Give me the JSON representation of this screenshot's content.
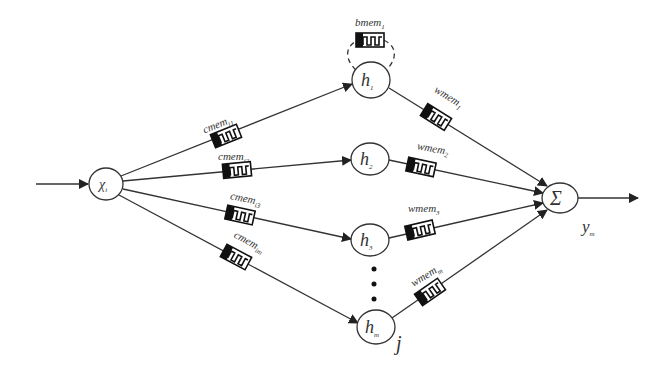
{
  "diagram": {
    "type": "memristor neural network",
    "colors": {
      "line": "#333333",
      "background": "#ffffff",
      "memristor_fill": "#111111"
    },
    "nodes": {
      "input": {
        "label": "χ",
        "sub": "i"
      },
      "h1": {
        "label": "h",
        "sub": "1"
      },
      "h2": {
        "label": "h",
        "sub": "2"
      },
      "h3": {
        "label": "h",
        "sub": "3"
      },
      "hm": {
        "label": "h",
        "sub": "m"
      },
      "sum": {
        "label": "Σ"
      }
    },
    "labels": {
      "output": "y",
      "output_sub": "m",
      "index": "j",
      "ellipsis": "⋮"
    },
    "memristors": {
      "bias": {
        "label": "bmem",
        "sub": "1"
      },
      "in": [
        {
          "label": "cmem",
          "sub": "i1"
        },
        {
          "label": "cmem",
          "sub": "i2"
        },
        {
          "label": "cmem",
          "sub": "i3"
        },
        {
          "label": "cmem",
          "sub": "im"
        }
      ],
      "out": [
        {
          "label": "wmem",
          "sub": "1"
        },
        {
          "label": "wmem",
          "sub": "2"
        },
        {
          "label": "wmem",
          "sub": "3"
        },
        {
          "label": "wmem",
          "sub": "m"
        }
      ]
    }
  }
}
